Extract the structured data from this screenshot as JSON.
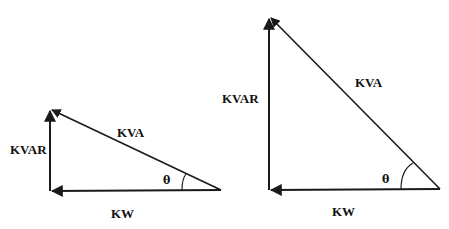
{
  "diagram": {
    "type": "power-triangles",
    "stroke_color": "#1a1a1a",
    "background": "#ffffff",
    "triangles": [
      {
        "id": "small",
        "labels": {
          "vertical": "KVAR",
          "hypotenuse": "KVA",
          "horizontal": "KW",
          "angle": "θ"
        }
      },
      {
        "id": "large",
        "labels": {
          "vertical": "KVAR",
          "hypotenuse": "KVA",
          "horizontal": "KW",
          "angle": "θ"
        }
      }
    ]
  }
}
